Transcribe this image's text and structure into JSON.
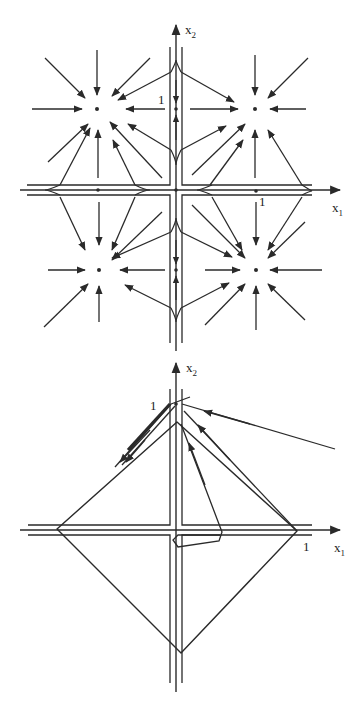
{
  "style": {
    "stroke": "#2a2a2a",
    "background": "#ffffff"
  },
  "figures": [
    {
      "id": "top-phase-portrait",
      "axes": {
        "x": {
          "from": [
            20,
            190
          ],
          "to": [
            340,
            190
          ],
          "label": "x",
          "sub": "1",
          "label_pos": [
            332,
            212
          ]
        },
        "y": {
          "from": [
            176,
            351
          ],
          "to": [
            176,
            25
          ],
          "label": "x",
          "sub": "2",
          "label_pos": [
            185,
            34
          ]
        },
        "tick_labels": [
          {
            "text": "1",
            "pos": [
              158,
              104
            ]
          },
          {
            "text": "1",
            "pos": [
              259,
              206
            ]
          }
        ]
      },
      "separatrix_lines": [
        [
          [
            27,
            185
          ],
          [
            170,
            185
          ],
          [
            170,
            47
          ]
        ],
        [
          [
            27,
            195
          ],
          [
            170,
            195
          ],
          [
            170,
            343
          ]
        ],
        [
          [
            182,
            47
          ],
          [
            182,
            185
          ],
          [
            312,
            185
          ]
        ],
        [
          [
            182,
            343
          ],
          [
            182,
            195
          ],
          [
            312,
            195
          ]
        ]
      ],
      "equilibria": {
        "nodes": [
          [
            97,
            109
          ],
          [
            255,
            109
          ],
          [
            99,
            270
          ],
          [
            256,
            270
          ]
        ],
        "saddles": [
          [
            98,
            190
          ],
          [
            256,
            191
          ],
          [
            176,
            109
          ],
          [
            176,
            270
          ],
          [
            176,
            190
          ]
        ]
      },
      "arrows": [
        [
          [
            45,
            58
          ],
          [
            85,
            98
          ]
        ],
        [
          [
            97,
            50
          ],
          [
            97,
            95
          ]
        ],
        [
          [
            150,
            58
          ],
          [
            112,
            96
          ]
        ],
        [
          [
            32,
            109
          ],
          [
            82,
            109
          ]
        ],
        [
          [
            165,
            109
          ],
          [
            126,
            109
          ]
        ],
        [
          [
            48,
            162
          ],
          [
            88,
            124
          ]
        ],
        [
          [
            162,
            178
          ],
          [
            110,
            122
          ]
        ],
        [
          [
            171,
            72
          ],
          [
            118,
            100
          ]
        ],
        [
          [
            171,
            150
          ],
          [
            128,
            124
          ]
        ],
        [
          [
            98,
            178
          ],
          [
            98,
            130
          ]
        ],
        [
          [
            60,
            185
          ],
          [
            90,
            128
          ]
        ],
        [
          [
            135,
            185
          ],
          [
            113,
            140
          ]
        ],
        [
          [
            255,
            55
          ],
          [
            255,
            95
          ]
        ],
        [
          [
            308,
            58
          ],
          [
            268,
            98
          ]
        ],
        [
          [
            306,
            109
          ],
          [
            270,
            109
          ]
        ],
        [
          [
            190,
            109
          ],
          [
            238,
            109
          ]
        ],
        [
          [
            181,
            72
          ],
          [
            234,
            102
          ]
        ],
        [
          [
            181,
            150
          ],
          [
            226,
            126
          ]
        ],
        [
          [
            192,
            175
          ],
          [
            245,
            124
          ]
        ],
        [
          [
            210,
            185
          ],
          [
            243,
            140
          ]
        ],
        [
          [
            255,
            178
          ],
          [
            255,
            130
          ]
        ],
        [
          [
            302,
            185
          ],
          [
            268,
            130
          ]
        ],
        [
          [
            44,
            327
          ],
          [
            88,
            284
          ]
        ],
        [
          [
            99,
            322
          ],
          [
            99,
            286
          ]
        ],
        [
          [
            48,
            270
          ],
          [
            85,
            270
          ]
        ],
        [
          [
            165,
            270
          ],
          [
            120,
            270
          ]
        ],
        [
          [
            162,
            212
          ],
          [
            112,
            260
          ]
        ],
        [
          [
            171,
            232
          ],
          [
            112,
            258
          ]
        ],
        [
          [
            171,
            308
          ],
          [
            125,
            285
          ]
        ],
        [
          [
            60,
            197
          ],
          [
            85,
            250
          ]
        ],
        [
          [
            99,
            202
          ],
          [
            99,
            245
          ]
        ],
        [
          [
            135,
            197
          ],
          [
            112,
            250
          ]
        ],
        [
          [
            205,
            270
          ],
          [
            240,
            270
          ]
        ],
        [
          [
            181,
            232
          ],
          [
            232,
            257
          ]
        ],
        [
          [
            181,
            308
          ],
          [
            229,
            283
          ]
        ],
        [
          [
            205,
            325
          ],
          [
            245,
            284
          ]
        ],
        [
          [
            256,
            330
          ],
          [
            256,
            286
          ]
        ],
        [
          [
            305,
            320
          ],
          [
            268,
            284
          ]
        ],
        [
          [
            322,
            270
          ],
          [
            270,
            270
          ]
        ],
        [
          [
            305,
            222
          ],
          [
            268,
            258
          ]
        ],
        [
          [
            192,
            205
          ],
          [
            245,
            258
          ]
        ],
        [
          [
            212,
            197
          ],
          [
            242,
            250
          ]
        ],
        [
          [
            256,
            202
          ],
          [
            256,
            245
          ]
        ],
        [
          [
            302,
            197
          ],
          [
            268,
            250
          ]
        ]
      ],
      "axis_arrows_small": [
        [
          [
            176,
            80
          ],
          [
            176,
            103
          ]
        ],
        [
          [
            176,
            140
          ],
          [
            176,
            115
          ]
        ],
        [
          [
            176,
            240
          ],
          [
            176,
            264
          ]
        ],
        [
          [
            176,
            300
          ],
          [
            176,
            276
          ]
        ]
      ]
    },
    {
      "id": "bottom-phase-portrait",
      "axes": {
        "x": {
          "from": [
            20,
            530
          ],
          "to": [
            340,
            530
          ],
          "label": "x",
          "sub": "1",
          "label_pos": [
            334,
            552
          ]
        },
        "y": {
          "from": [
            176,
            692
          ],
          "to": [
            176,
            363
          ],
          "label": "x",
          "sub": "2",
          "label_pos": [
            186,
            372
          ]
        },
        "tick_labels": [
          {
            "text": "1",
            "pos": [
              150,
              410
            ]
          },
          {
            "text": "1",
            "pos": [
              303,
              551
            ]
          }
        ]
      },
      "separatrix_lines": [
        [
          [
            28,
            525
          ],
          [
            170,
            525
          ],
          [
            170,
            389
          ]
        ],
        [
          [
            28,
            535
          ],
          [
            170,
            535
          ],
          [
            170,
            683
          ]
        ],
        [
          [
            182,
            389
          ],
          [
            182,
            525
          ],
          [
            312,
            525
          ]
        ],
        [
          [
            182,
            683
          ],
          [
            182,
            535
          ],
          [
            312,
            535
          ]
        ]
      ],
      "diamond": [
        [
          177,
          422
        ],
        [
          297,
          531
        ],
        [
          181,
          653
        ],
        [
          57,
          529
        ]
      ],
      "trajectories": [
        {
          "points": [
            [
              335,
              449
            ],
            [
              182,
              404
            ]
          ],
          "arrow_at": [
            [
              250,
              424
            ],
            [
              204,
              411
            ]
          ]
        },
        {
          "points": [
            [
              297,
              531
            ],
            [
              184,
              411
            ]
          ],
          "arrow_at": [
            [
              230,
              460
            ],
            [
              198,
              425
            ]
          ]
        },
        {
          "points": [
            [
              220,
              535
            ],
            [
              178,
              535
            ],
            [
              173,
              540
            ],
            [
              178,
              547
            ],
            [
              219,
              541
            ],
            [
              222,
              532
            ],
            [
              181,
              424
            ]
          ],
          "arrow_at": [
            [
              205,
              485
            ],
            [
              189,
              443
            ]
          ]
        },
        {
          "points": [
            [
              171,
              404
            ],
            [
              115,
              467
            ]
          ],
          "arrow_at": [
            [
              150,
              430
            ],
            [
              120,
              462
            ]
          ]
        },
        {
          "points": [
            [
              175,
              406
            ],
            [
              122,
              465
            ]
          ],
          "arrow_at": [
            [
              145,
              440
            ],
            [
              126,
              462
            ]
          ]
        },
        {
          "points": [
            [
              171,
              404
            ],
            [
              190,
              397
            ]
          ],
          "arrow_at": null
        }
      ],
      "thick_segment": [
        [
          170,
          404
        ],
        [
          128,
          450
        ]
      ]
    }
  ]
}
